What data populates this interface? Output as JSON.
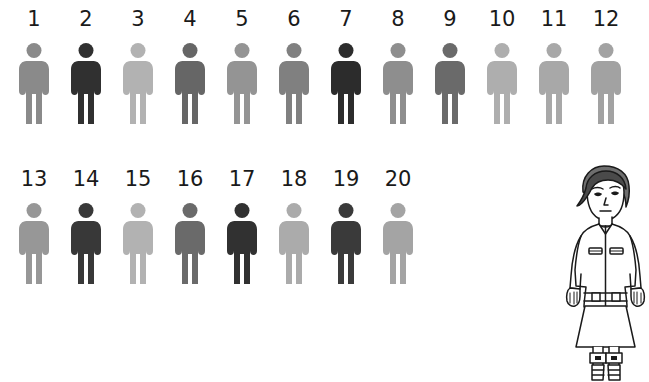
{
  "canvas": {
    "width": 649,
    "height": 382,
    "background": "#ffffff"
  },
  "chart_data": {
    "type": "pictogram",
    "title": "",
    "xlabel": "",
    "ylabel": "",
    "categories": [
      "1",
      "2",
      "3",
      "4",
      "5",
      "6",
      "7",
      "8",
      "9",
      "10",
      "11",
      "12",
      "13",
      "14",
      "15",
      "16",
      "17",
      "18",
      "19",
      "20"
    ],
    "values": [
      0.55,
      0.88,
      0.3,
      0.68,
      0.46,
      0.58,
      0.9,
      0.52,
      0.66,
      0.32,
      0.36,
      0.4,
      0.5,
      0.86,
      0.3,
      0.66,
      0.88,
      0.33,
      0.85,
      0.38
    ],
    "value_meaning": "relative darkness of each figure (0 = white, 1 = black)",
    "colors": [
      "#8a8a8a",
      "#303030",
      "#b2b2b2",
      "#666666",
      "#949494",
      "#808080",
      "#2c2c2c",
      "#8e8e8e",
      "#6a6a6a",
      "#aeaeae",
      "#a8a8a8",
      "#a2a2a2",
      "#979797",
      "#383838",
      "#b2b2b2",
      "#6a6a6a",
      "#313131",
      "#ababab",
      "#3a3a3a",
      "#a4a4a4"
    ],
    "rows": 2,
    "per_row": [
      12,
      8
    ],
    "grid": false,
    "legend": "none"
  },
  "figures": {
    "icon_name": "person-pictogram-icon",
    "row_1": [
      {
        "label": "1",
        "color": "#8a8a8a"
      },
      {
        "label": "2",
        "color": "#303030"
      },
      {
        "label": "3",
        "color": "#b2b2b2"
      },
      {
        "label": "4",
        "color": "#666666"
      },
      {
        "label": "5",
        "color": "#949494"
      },
      {
        "label": "6",
        "color": "#808080"
      },
      {
        "label": "7",
        "color": "#2c2c2c"
      },
      {
        "label": "8",
        "color": "#8e8e8e"
      },
      {
        "label": "9",
        "color": "#6a6a6a"
      },
      {
        "label": "10",
        "color": "#aeaeae"
      },
      {
        "label": "11",
        "color": "#a8a8a8"
      },
      {
        "label": "12",
        "color": "#a2a2a2"
      }
    ],
    "row_2": [
      {
        "label": "13",
        "color": "#979797"
      },
      {
        "label": "14",
        "color": "#383838"
      },
      {
        "label": "15",
        "color": "#b2b2b2"
      },
      {
        "label": "16",
        "color": "#6a6a6a"
      },
      {
        "label": "17",
        "color": "#313131"
      },
      {
        "label": "18",
        "color": "#ababab"
      },
      {
        "label": "19",
        "color": "#3a3a3a"
      },
      {
        "label": "20",
        "color": "#a4a4a4"
      }
    ]
  },
  "character": {
    "name": "character-illustration",
    "style": "black-and-white line art",
    "hair_color": "#6e6e6e",
    "outline_color": "#1a1a1a",
    "fill_color": "#ffffff",
    "parts": [
      "hair",
      "face",
      "jacket",
      "chest-pockets",
      "belt",
      "skirt",
      "legs",
      "buckled-boots"
    ]
  }
}
